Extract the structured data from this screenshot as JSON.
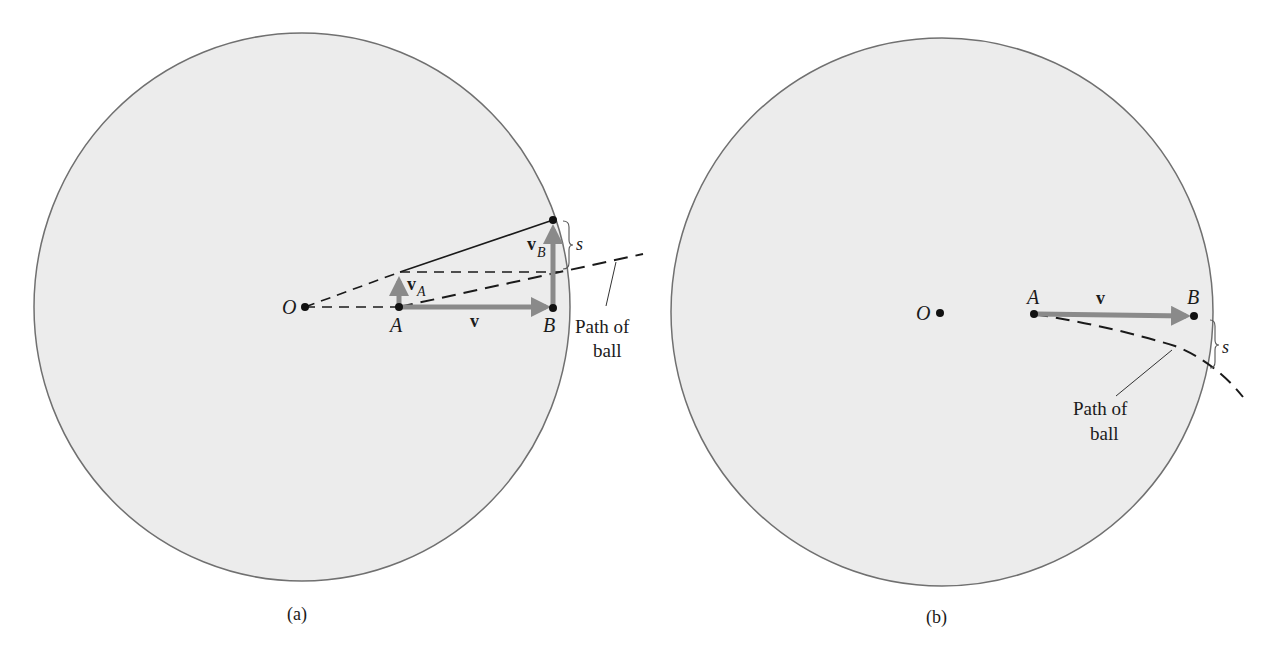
{
  "figure": {
    "panels": [
      {
        "id": "a",
        "caption": "(a)",
        "labels": {
          "origin": "O",
          "point_a": "A",
          "point_b": "B",
          "velocity": "v",
          "velocity_a_main": "v",
          "velocity_a_sub": "A",
          "velocity_b_main": "v",
          "velocity_b_sub": "B",
          "deflection": "s",
          "path_line1": "Path of",
          "path_line2": "ball"
        }
      },
      {
        "id": "b",
        "caption": "(b)",
        "labels": {
          "origin": "O",
          "point_a": "A",
          "point_b": "B",
          "velocity": "v",
          "deflection": "s",
          "path_line1": "Path of",
          "path_line2": "ball"
        }
      }
    ],
    "colors": {
      "disk_fill": "#ececec",
      "disk_stroke": "#707070",
      "vector": "#8a8a8a",
      "line": "#1a1a1a"
    }
  }
}
